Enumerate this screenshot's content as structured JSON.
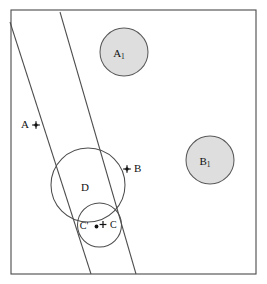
{
  "figure": {
    "background_color": "#ffffff",
    "frame": {
      "x": 11,
      "y": 10,
      "width": 245,
      "height": 264,
      "stroke_color": "#4a4a4a",
      "stroke_width": 1.1
    },
    "band": {
      "name": "parallel-strip",
      "stroke_color": "#4d4d4d",
      "stroke_width": 1.05,
      "left_line": {
        "x1": 10,
        "y1": 22,
        "x2": 91,
        "y2": 274
      },
      "right_line": {
        "x1": 60,
        "y1": 12,
        "x2": 136,
        "y2": 274
      }
    },
    "shaded_circles": [
      {
        "id": "A1",
        "label": "A",
        "subscript": "1",
        "cx": 124,
        "cy": 52,
        "r": 24,
        "fill": "#dedede",
        "stroke": "#5a5a5a",
        "label_x": 120,
        "label_y": 54
      },
      {
        "id": "B1",
        "label": "B",
        "subscript": "1",
        "cx": 210,
        "cy": 160,
        "r": 24,
        "fill": "#dedede",
        "stroke": "#5a5a5a",
        "label_x": 206,
        "label_y": 162
      }
    ],
    "open_circles": [
      {
        "id": "D",
        "label": "D",
        "cx": 88,
        "cy": 185,
        "r": 37,
        "fill": "none",
        "stroke": "#4d4d4d",
        "label_x": 85,
        "label_y": 188
      },
      {
        "id": "C",
        "label": "",
        "cx": 99.5,
        "cy": 225,
        "r": 22,
        "fill": "none",
        "stroke": "#4d4d4d",
        "label_x": 0,
        "label_y": 0
      }
    ],
    "points": [
      {
        "id": "A",
        "label": "A",
        "label_x": 25,
        "label_y": 125,
        "marker_x": 36,
        "marker_y": 125,
        "marker_style": "plus-dot",
        "label_side": "left"
      },
      {
        "id": "B",
        "label": "B",
        "label_x": 134,
        "label_y": 169,
        "marker_x": 127,
        "marker_y": 169,
        "marker_style": "plus-dot",
        "label_side": "right"
      },
      {
        "id": "Cprime",
        "label": "C'",
        "label_x": 84,
        "label_y": 227,
        "marker_x": 97,
        "marker_y": 227,
        "marker_style": "dot",
        "label_side": "left"
      },
      {
        "id": "Ccenter",
        "label": "C",
        "label_x": 110,
        "label_y": 226,
        "marker_x": 103,
        "marker_y": 225,
        "marker_style": "plus",
        "label_side": "right"
      }
    ],
    "colors": {
      "shaded_fill": "#dedede",
      "line_stroke": "#4d4d4d",
      "frame_stroke": "#4a4a4a",
      "text": "#111111"
    }
  }
}
